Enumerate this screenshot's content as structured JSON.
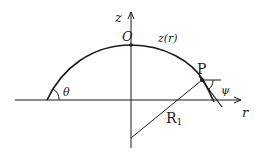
{
  "figure": {
    "type": "meniscus-geometry-diagram",
    "axes": {
      "vertical_label": "z",
      "horizontal_label": "r"
    },
    "labels": {
      "origin": "O",
      "curve": "z(r)",
      "point": "P",
      "contact_angle": "θ",
      "tangent_angle": "ψ",
      "radius_main": "R",
      "radius_sub": "1"
    },
    "colors": {
      "stroke": "#1a1a1a",
      "background": "#ffffff"
    }
  }
}
